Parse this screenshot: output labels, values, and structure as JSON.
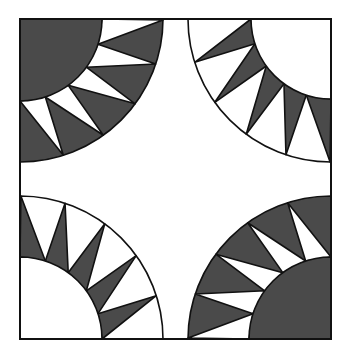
{
  "title": "Quilt block pattern",
  "colors": {
    "dark": "#4a4a4a",
    "light": "#ffffff",
    "line": "#111111"
  },
  "block": {
    "x": 20,
    "y": 19,
    "size": 311,
    "height": 320
  },
  "quadrants": [
    {
      "name": "top-left",
      "corner": [
        20,
        19
      ],
      "dir": [
        1,
        1
      ],
      "outer_r": 143,
      "inner_r": 82,
      "ring_fill": "dark",
      "teeth_fill": "light",
      "center_fill": "dark",
      "teeth": 5
    },
    {
      "name": "top-right",
      "corner": [
        331,
        19
      ],
      "dir": [
        -1,
        1
      ],
      "outer_r": 143,
      "inner_r": 80,
      "ring_fill": "light",
      "teeth_fill": "dark",
      "center_fill": "light",
      "teeth": 5
    },
    {
      "name": "bottom-left",
      "corner": [
        20,
        339
      ],
      "dir": [
        1,
        -1
      ],
      "outer_r": 143,
      "inner_r": 82,
      "ring_fill": "light",
      "teeth_fill": "dark",
      "center_fill": "light",
      "teeth": 5
    },
    {
      "name": "bottom-right",
      "corner": [
        331,
        339
      ],
      "dir": [
        -1,
        -1
      ],
      "outer_r": 143,
      "inner_r": 82,
      "ring_fill": "dark",
      "teeth_fill": "light",
      "center_fill": "dark",
      "teeth": 5
    }
  ]
}
